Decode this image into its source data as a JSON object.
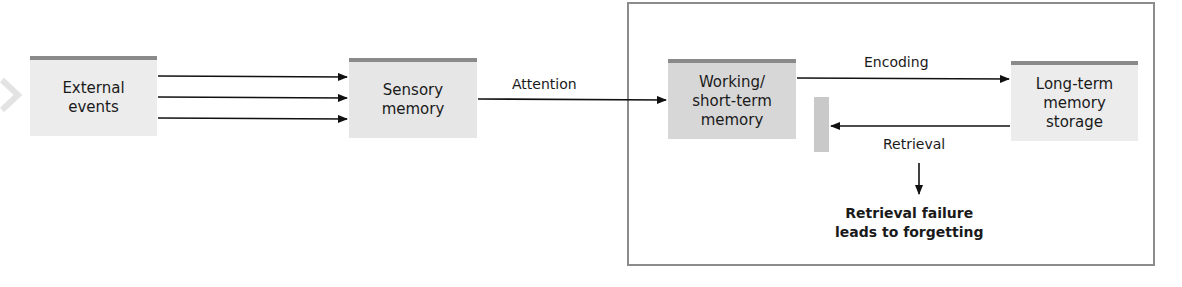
{
  "diagram": {
    "title": "",
    "nodes": {
      "external": {
        "label": "External\nevents"
      },
      "sensory": {
        "label": "Sensory\nmemory"
      },
      "working": {
        "label": "Working/\nshort-term\nmemory"
      },
      "longterm": {
        "label": "Long-term\nmemory\nstorage"
      }
    },
    "edges": {
      "attention": {
        "label": "Attention"
      },
      "encoding": {
        "label": "Encoding"
      },
      "retrieval": {
        "label": "Retrieval"
      }
    },
    "outcome": {
      "label": "Retrieval failure\nleads to forgetting"
    },
    "colors": {
      "box_fill": "#e6e6e6",
      "box_top_bar": "#8a8a8a",
      "frame": "#8c8c8c",
      "arrow": "#111111"
    }
  }
}
